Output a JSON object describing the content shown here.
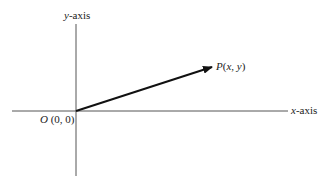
{
  "diagram": {
    "type": "coordinate-plane-vector",
    "axes": {
      "x_label_var": "x",
      "x_label_suffix": "-axis",
      "y_label_var": "y",
      "y_label_suffix": "-axis"
    },
    "origin": {
      "name": "O",
      "coords": "(0, 0)"
    },
    "point": {
      "name": "P",
      "open": "(",
      "x": "x",
      "sep": ", ",
      "y": "y",
      "close": ")"
    },
    "colors": {
      "axis": "#555555",
      "vector": "#111111",
      "text": "#222222"
    }
  }
}
